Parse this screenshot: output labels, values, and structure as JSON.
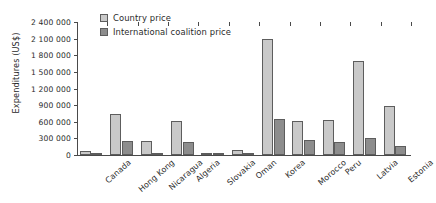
{
  "chart_data": {
    "type": "bar",
    "title": "",
    "xlabel": "",
    "ylabel": "Expenditures (US$)",
    "ylim": [
      0,
      2400000
    ],
    "ytick_values": [
      0,
      300000,
      600000,
      900000,
      1200000,
      1500000,
      1800000,
      2100000,
      2400000
    ],
    "ytick_labels": [
      "0",
      "300 000",
      "600 000",
      "900 000",
      "1 200 000",
      "1 500 000",
      "1 800 000",
      "2 100 000",
      "2 400 000"
    ],
    "grid": false,
    "legend_position": "top-left",
    "categories": [
      "Canada",
      "Hong Kong",
      "Nicaragua",
      "Algeria",
      "Slovakia",
      "Oman",
      "Korea",
      "Morocco",
      "Peru",
      "Latvia",
      "Estonia"
    ],
    "series": [
      {
        "name": "Country price",
        "color": "#c9c9c9",
        "values": [
          75000,
          740000,
          245000,
          605000,
          30000,
          95000,
          2100000,
          615000,
          630000,
          1700000,
          890000
        ]
      },
      {
        "name": "International coalition price",
        "color": "#8d8d8d",
        "values": [
          20000,
          260000,
          35000,
          235000,
          20000,
          22000,
          645000,
          275000,
          235000,
          310000,
          160000
        ]
      }
    ]
  },
  "legend": {
    "items": [
      {
        "label": "Country price"
      },
      {
        "label": "International coalition price"
      }
    ]
  }
}
